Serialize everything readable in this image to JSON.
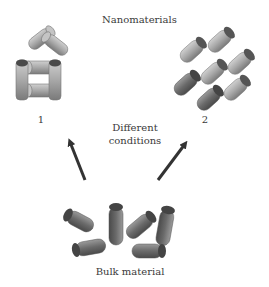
{
  "title": "Nanomaterials",
  "structures": [
    {
      "id": "1",
      "label": "1",
      "description": "house-like assembly of rods"
    },
    {
      "id": "2",
      "label": "2",
      "description": "stacked parallel rod lattice"
    }
  ],
  "transition_label_line1": "Different",
  "transition_label_line2": "conditions",
  "bulk_label": "Bulk material",
  "colors": {
    "rod_body": "#a8a8a8",
    "rod_cap": "#555555",
    "rod_dark": "#6e6e6e",
    "arrow": "#333333",
    "text": "#3a3a3a"
  }
}
